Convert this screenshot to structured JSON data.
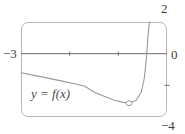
{
  "chart_data": {
    "type": "line",
    "title": "",
    "curve_label": "y = f(x)",
    "xlim": [
      -3,
      0
    ],
    "ylim": [
      -4,
      2
    ],
    "x_ticks": [
      -2,
      -1
    ],
    "y_edge_ticks": [
      -2
    ],
    "edge_labels": {
      "left": "−3",
      "right": "0",
      "top_right": "2",
      "bottom_right": "−4"
    },
    "grid": false,
    "legend_position": "inside-bottom-left",
    "series": [
      {
        "name": "y = f(x)",
        "points": [
          [
            -3.0,
            -1.2
          ],
          [
            -2.6,
            -1.45
          ],
          [
            -2.2,
            -1.7
          ],
          [
            -1.9,
            -1.9
          ],
          [
            -1.69,
            -2.06
          ],
          [
            -1.49,
            -2.44
          ],
          [
            -1.29,
            -2.69
          ],
          [
            -1.08,
            -2.94
          ],
          [
            -0.92,
            -3.06
          ],
          [
            -0.78,
            -3.13
          ],
          [
            -0.63,
            -2.94
          ],
          [
            -0.53,
            -2.44
          ],
          [
            -0.47,
            -1.63
          ],
          [
            -0.43,
            -0.5
          ],
          [
            -0.41,
            0.25
          ],
          [
            -0.38,
            1.5
          ],
          [
            -0.36,
            2.0
          ]
        ]
      }
    ],
    "marker": {
      "x": -0.78,
      "y": -3.13,
      "style": "open-circle"
    },
    "colors": {
      "curve": "#9a9a9a",
      "axis": "#6e6e6e",
      "box_border": "#b7b7b7",
      "text": "#3d3d3d",
      "background": "#ffffff"
    }
  }
}
